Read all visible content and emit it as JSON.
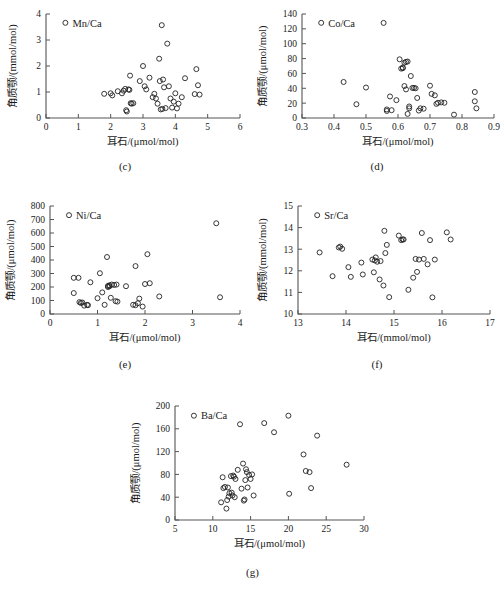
{
  "figure": {
    "title": "",
    "panels": [
      "c",
      "d",
      "e",
      "f",
      "g"
    ]
  },
  "captions": {
    "c": "(c)",
    "d": "(d)",
    "e": "(e)",
    "f": "(f)",
    "g": "(g)"
  },
  "chart_data": [
    {
      "id": "c",
      "type": "scatter",
      "title": "",
      "legend": [
        "Mn/Ca"
      ],
      "legend_position": "top-left",
      "grid": false,
      "xlabel": "耳石/(μmol/mol)",
      "ylabel": "角质颚/(mmol/mol)",
      "xlim": [
        0,
        6
      ],
      "ylim": [
        0,
        4
      ],
      "xticks": [
        0,
        1,
        2,
        3,
        4,
        5,
        6
      ],
      "yticks": [
        0,
        1,
        2,
        3,
        4
      ],
      "x": [
        1.8,
        2.0,
        2.05,
        2.22,
        2.35,
        2.4,
        2.45,
        2.48,
        2.5,
        2.55,
        2.58,
        2.6,
        2.62,
        2.65,
        2.7,
        2.9,
        3.0,
        3.05,
        3.1,
        3.2,
        3.3,
        3.35,
        3.4,
        3.45,
        3.5,
        3.52,
        3.55,
        3.58,
        3.6,
        3.62,
        3.65,
        3.7,
        3.75,
        3.8,
        3.85,
        3.9,
        3.95,
        4.0,
        4.05,
        4.1,
        4.2,
        4.3,
        4.6,
        4.65,
        4.7,
        4.75
      ],
      "y": [
        0.93,
        0.95,
        0.87,
        1.03,
        0.95,
        1.05,
        1.12,
        0.3,
        0.25,
        1.1,
        1.08,
        1.63,
        0.57,
        0.55,
        0.57,
        1.42,
        2.0,
        1.22,
        1.1,
        1.55,
        0.8,
        0.93,
        0.75,
        0.55,
        2.28,
        1.42,
        0.33,
        3.57,
        0.35,
        1.48,
        1.18,
        0.38,
        2.86,
        1.22,
        0.75,
        0.4,
        0.63,
        0.95,
        0.37,
        0.55,
        0.8,
        1.53,
        0.92,
        1.88,
        1.26,
        0.9
      ]
    },
    {
      "id": "d",
      "type": "scatter",
      "title": "",
      "legend": [
        "Co/Ca"
      ],
      "legend_position": "top-left",
      "grid": false,
      "xlabel": "耳石/(μmol/mol)",
      "ylabel": "角质颚/(μmol/mol)",
      "xlim": [
        0.3,
        0.9
      ],
      "ylim": [
        0,
        140
      ],
      "xticks": [
        0.3,
        0.4,
        0.5,
        0.6,
        0.7,
        0.8,
        0.9
      ],
      "yticks": [
        0,
        20,
        40,
        60,
        80,
        100,
        120,
        140
      ],
      "x": [
        0.43,
        0.47,
        0.5,
        0.555,
        0.565,
        0.565,
        0.575,
        0.58,
        0.595,
        0.605,
        0.61,
        0.615,
        0.615,
        0.62,
        0.62,
        0.625,
        0.625,
        0.63,
        0.63,
        0.635,
        0.635,
        0.64,
        0.645,
        0.65,
        0.655,
        0.66,
        0.665,
        0.67,
        0.68,
        0.7,
        0.705,
        0.715,
        0.72,
        0.725,
        0.735,
        0.745,
        0.775,
        0.84,
        0.84,
        0.845
      ],
      "y": [
        48.5,
        18.5,
        41.0,
        128.0,
        9.5,
        11.5,
        29.0,
        10.5,
        24.0,
        79.0,
        66.5,
        68.0,
        67.0,
        74.5,
        43.0,
        75.5,
        38.5,
        76.0,
        5.5,
        15.5,
        13.0,
        56.5,
        40.5,
        40.5,
        40.0,
        27.0,
        10.0,
        13.0,
        12.5,
        43.5,
        32.5,
        30.5,
        19.0,
        20.5,
        21.0,
        20.5,
        4.5,
        35.0,
        22.5,
        13.0
      ]
    },
    {
      "id": "e",
      "type": "scatter",
      "title": "",
      "legend": [
        "Ni/Ca"
      ],
      "legend_position": "top-left",
      "grid": false,
      "xlabel": "耳石/(μmol/mol)",
      "ylabel": "角质颚/(μmol/mol)",
      "xlim": [
        0,
        4
      ],
      "ylim": [
        0,
        800
      ],
      "xticks": [
        0,
        1,
        2,
        3,
        4
      ],
      "yticks": [
        0,
        100,
        200,
        300,
        400,
        500,
        600,
        700,
        800
      ],
      "x": [
        0.5,
        0.5,
        0.6,
        0.62,
        0.65,
        0.68,
        0.72,
        0.78,
        0.8,
        0.85,
        1.0,
        1.05,
        1.1,
        1.15,
        1.2,
        1.22,
        1.22,
        1.25,
        1.25,
        1.28,
        1.3,
        1.35,
        1.38,
        1.4,
        1.42,
        1.6,
        1.75,
        1.8,
        1.8,
        1.85,
        1.88,
        1.95,
        2.0,
        2.05,
        2.1,
        2.3,
        3.5,
        3.58
      ],
      "y": [
        268.0,
        155.0,
        268.0,
        88.0,
        82.0,
        85.0,
        62.0,
        68.0,
        65.0,
        235.0,
        117.0,
        302.0,
        160.0,
        68.0,
        422.0,
        208.0,
        200.0,
        213.0,
        205.0,
        120.0,
        218.0,
        215.0,
        95.0,
        218.0,
        92.0,
        206.0,
        68.0,
        65.0,
        355.0,
        80.0,
        114.0,
        55.0,
        222.0,
        443.0,
        228.0,
        130.0,
        672.0,
        124.0
      ]
    },
    {
      "id": "f",
      "type": "scatter",
      "title": "",
      "legend": [
        "Sr/Ca"
      ],
      "legend_position": "top-left",
      "grid": false,
      "xlabel": "耳石/(mmol/mol)",
      "ylabel": "角质颚/(mmol/mol)",
      "xlim": [
        13,
        17
      ],
      "ylim": [
        10,
        15
      ],
      "xticks": [
        13,
        14,
        15,
        16,
        17
      ],
      "yticks": [
        10,
        11,
        12,
        13,
        14,
        15
      ],
      "x": [
        13.45,
        13.72,
        13.85,
        13.88,
        13.92,
        14.05,
        14.1,
        14.32,
        14.35,
        14.55,
        14.58,
        14.6,
        14.62,
        14.65,
        14.7,
        14.72,
        14.78,
        14.8,
        14.82,
        14.85,
        14.9,
        15.1,
        15.15,
        15.18,
        15.2,
        15.3,
        15.4,
        15.45,
        15.48,
        15.52,
        15.58,
        15.62,
        15.7,
        15.75,
        15.8,
        15.85,
        16.1,
        16.18
      ],
      "y": [
        12.85,
        11.75,
        13.08,
        13.12,
        13.02,
        12.17,
        11.72,
        12.38,
        11.83,
        12.52,
        11.93,
        12.48,
        12.62,
        12.42,
        11.6,
        12.45,
        11.32,
        13.85,
        12.82,
        13.2,
        10.78,
        13.63,
        13.42,
        13.45,
        13.45,
        11.12,
        11.68,
        12.55,
        11.95,
        12.52,
        13.75,
        12.55,
        12.3,
        13.42,
        10.77,
        12.52,
        13.78,
        13.45
      ]
    },
    {
      "id": "g",
      "type": "scatter",
      "title": "",
      "legend": [
        "Ba/Ca"
      ],
      "legend_position": "top-left",
      "grid": false,
      "xlabel": "耳石/(μmol/mol)",
      "ylabel": "角质颚/(μmol/mol)",
      "xlim": [
        5,
        30
      ],
      "ylim": [
        0,
        200
      ],
      "xticks": [
        5,
        10,
        15,
        20,
        25,
        30
      ],
      "yticks": [
        0,
        40,
        80,
        120,
        160,
        200
      ],
      "x": [
        11.1,
        11.3,
        11.4,
        11.6,
        11.8,
        11.9,
        12.0,
        12.1,
        12.2,
        12.4,
        12.5,
        12.6,
        12.7,
        12.8,
        12.9,
        13.0,
        13.3,
        13.6,
        13.8,
        14.0,
        14.1,
        14.2,
        14.3,
        14.4,
        14.5,
        14.6,
        14.8,
        15.0,
        15.2,
        15.4,
        16.8,
        18.1,
        20.0,
        20.1,
        22.0,
        22.3,
        22.8,
        23.0,
        23.8,
        27.7
      ],
      "y": [
        31.0,
        75.0,
        56.0,
        58.0,
        20.0,
        35.0,
        57.0,
        41.0,
        47.0,
        77.0,
        48.0,
        43.0,
        78.0,
        76.0,
        40.0,
        72.0,
        88.0,
        168.0,
        55.0,
        99.0,
        34.0,
        36.0,
        70.0,
        89.0,
        84.0,
        57.0,
        79.0,
        72.0,
        80.0,
        43.0,
        170.0,
        154.0,
        183.0,
        46.0,
        115.0,
        86.0,
        84.0,
        56.0,
        148.0,
        97.0
      ]
    }
  ]
}
